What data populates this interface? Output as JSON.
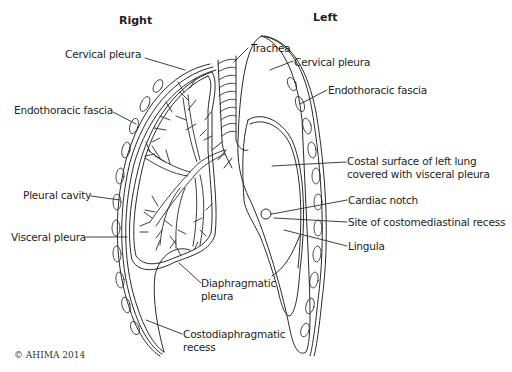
{
  "headings": {
    "right": "Right",
    "left": "Left"
  },
  "labels": {
    "right_cervical_pleura": "Cervical pleura",
    "trachea": "Trachea",
    "left_cervical_pleura": "Cervical pleura",
    "right_endothoracic_fascia": "Endothoracic fascia",
    "left_endothoracic_fascia": "Endothoracic fascia",
    "costal_surface_line1": "Costal surface of left lung",
    "costal_surface_line2": "covered with visceral pleura",
    "pleural_cavity": "Pleural cavity",
    "cardiac_notch": "Cardiac notch",
    "costomediastinal_recess": "Site of costomediastinal recess",
    "visceral_pleura": "Visceral pleura",
    "lingula": "Lingula",
    "diaphragmatic_pleura_line1": "Diaphragmatic",
    "diaphragmatic_pleura_line2": "pleura",
    "costodiaphragmatic_line1": "Costodiaphragmatic",
    "costodiaphragmatic_line2": "recess"
  },
  "copyright": "© AHIMA 2014",
  "colors": {
    "line": "#2a2a2a",
    "text": "#1e1e1e",
    "background": "#ffffff"
  }
}
